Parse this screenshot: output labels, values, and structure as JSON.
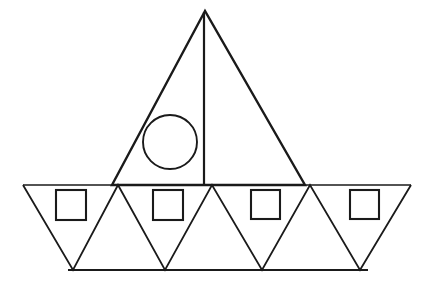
{
  "canvas": {
    "width": 430,
    "height": 297,
    "background_color": "#ffffff",
    "stroke_color": "#1a1a1a",
    "title": "Sailboat line drawing composed of triangles, squares and a circle"
  },
  "figure": {
    "name": "sailboat",
    "shape_counts": {
      "triangles": 8,
      "squares": 4,
      "circles": 1,
      "lines": 3
    }
  },
  "shapes": {
    "sail": {
      "label": "sail-triangle",
      "type": "triangle",
      "points": "205,11 112,185 305,185",
      "stroke_width": 2.4
    },
    "mast": {
      "label": "mast-line",
      "type": "line",
      "x1": 204,
      "y1": 12,
      "x2": 204,
      "y2": 186,
      "stroke_width": 2.2
    },
    "porthole": {
      "label": "porthole-circle",
      "type": "circle",
      "cx": 170,
      "cy": 142,
      "r": 27,
      "stroke_width": 1.9
    },
    "hull_top_line": {
      "label": "hull-top-line",
      "type": "line",
      "x1": 23,
      "y1": 185,
      "x2": 411,
      "y2": 185,
      "stroke_width": 1.7
    },
    "hull_bottom_line": {
      "label": "hull-bottom-line",
      "type": "line",
      "x1": 68,
      "y1": 270,
      "x2": 368,
      "y2": 270,
      "stroke_width": 1.9
    },
    "hull_zigzag": {
      "label": "hull-zigzag-path",
      "type": "polyline",
      "points": "23,185 73,270 118,185 165,270 212,185 262,270 310,185 360,270 411,185",
      "stroke_width": 1.8
    },
    "squares": [
      {
        "label": "square-1",
        "x": 56,
        "y": 190,
        "size": 30,
        "stroke_width": 2.1
      },
      {
        "label": "square-2",
        "x": 153,
        "y": 190,
        "size": 30,
        "stroke_width": 2.1
      },
      {
        "label": "square-3",
        "x": 251,
        "y": 190,
        "size": 29,
        "stroke_width": 2.1
      },
      {
        "label": "square-4",
        "x": 350,
        "y": 190,
        "size": 29,
        "stroke_width": 2.1
      }
    ]
  }
}
